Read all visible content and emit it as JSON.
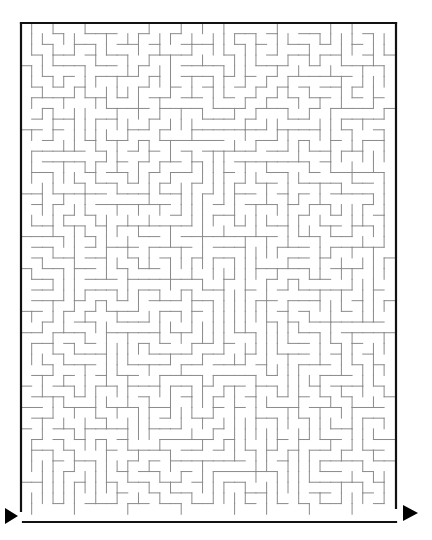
{
  "maze": {
    "cols": 35,
    "rows": 46,
    "origin": [
      21,
      23
    ],
    "cell": 10.68,
    "border_color": "#111111",
    "wall_color": "#8a8a8a",
    "border_width": 2.2,
    "wall_width": 1,
    "border": {
      "top": [
        21,
        23,
        396,
        23
      ],
      "right": [
        396,
        23,
        396,
        508
      ],
      "bottom": [
        23,
        522,
        396,
        522
      ],
      "left": [
        21,
        23,
        21,
        511
      ]
    },
    "start_arrow": {
      "label": "start-arrow",
      "points": "5,508 18,516 5,524",
      "color": "#000000"
    },
    "end_arrow": {
      "label": "end-arrow",
      "points": "403,505 418,513 403,521",
      "color": "#000000"
    },
    "seed": 5381
  }
}
